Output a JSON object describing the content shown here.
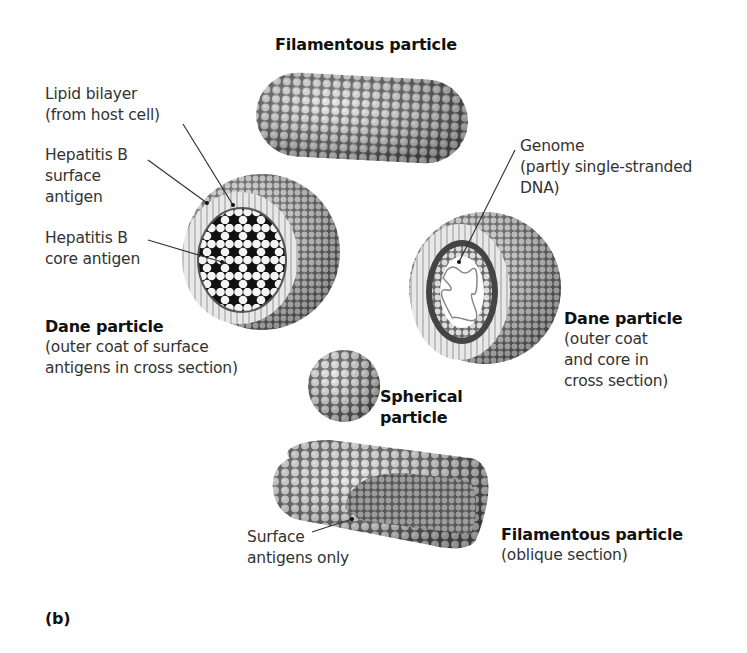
{
  "figure": {
    "panel_label": "(b)",
    "particles": {
      "filamentous_top": {
        "title": "Filamentous particle"
      },
      "dane_left": {
        "title": "Dane particle",
        "caption": [
          "(outer coat of surface",
          "antigens in cross section)"
        ]
      },
      "dane_right": {
        "title": "Dane particle",
        "caption": [
          "(outer coat",
          "and core in",
          "cross section)"
        ]
      },
      "spherical": {
        "title": [
          "Spherical",
          "particle"
        ]
      },
      "filamentous_bottom": {
        "title": "Filamentous particle",
        "caption": "(oblique section)"
      }
    },
    "callouts": {
      "lipid_bilayer": [
        "Lipid bilayer",
        "(from host cell)"
      ],
      "surface_antigen": [
        "Hepatitis B",
        "surface",
        "antigen"
      ],
      "core_antigen": [
        "Hepatitis B",
        "core antigen"
      ],
      "genome": [
        "Genome",
        "(partly single-stranded",
        "DNA)"
      ],
      "surface_antigens_only": [
        "Surface",
        "antigens only"
      ]
    }
  }
}
